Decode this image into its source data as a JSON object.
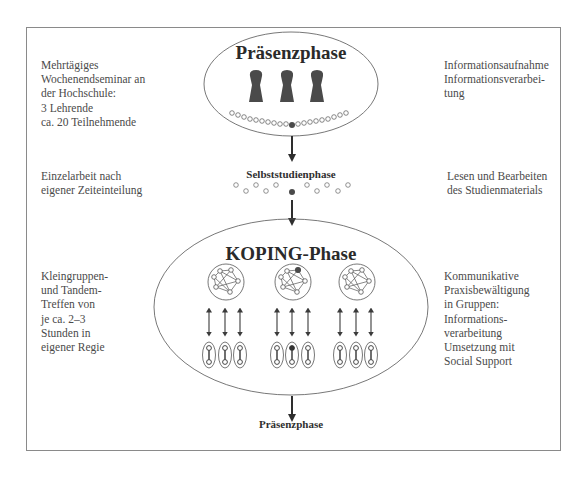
{
  "phases": {
    "praesenz": {
      "title": "Präsenzphase",
      "left_note": "Mehrtägiges\nWochenendseminar an\nder Hochschule:\n3 Lehrende\nca. 20 Teilnehmende",
      "right_note": "Informationsaufnahme\nInformationsverarbei-\ntung"
    },
    "selbststudium": {
      "title": "Selbststudienphase",
      "left_note": "Einzelarbeit nach\neigener Zeiteinteilung",
      "right_note": "Lesen und Bearbeiten\ndes Studienmaterials"
    },
    "koping": {
      "title": "KOPING-Phase",
      "left_note": "Kleingruppen-\nund Tandem-\nTreffen von\nje ca. 2–3\nStunden in\neigener Regie",
      "right_note": "Kommunikative\nPraxisbewältigung\nin Gruppen:\nInformations-\nverarbeitung\nUmsetzung mit\nSocial Support"
    },
    "next": {
      "title": "Präsenzphase"
    }
  },
  "diagram": {
    "teachers_count": 3,
    "participants_count": 20,
    "groups_count": 3,
    "tandems_per_group": 3,
    "colors": {
      "line": "#3a3a3a",
      "fill_dark": "#4a4a4a",
      "frame": "#8a8a8a"
    }
  }
}
